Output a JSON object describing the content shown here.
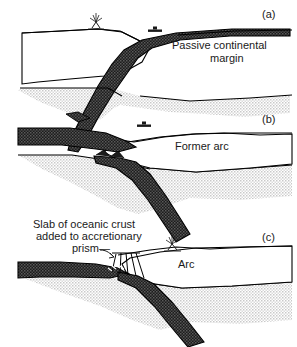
{
  "figure": {
    "type": "geologic-cross-section",
    "panel_count": 3,
    "width": 297,
    "height": 347
  },
  "colors": {
    "oceanic_crust_dark": "#2b2b2b",
    "mantle_stipple_gray": "#d9d9d9",
    "continent_fill": "#ffffff",
    "outline": "#000000",
    "text": "#1a1a1a"
  },
  "panels": [
    {
      "id": "a",
      "letter": "(a)",
      "label": "Passive continental\nmargin",
      "label_line1": "Passive continental",
      "label_line2": "margin",
      "icons": [
        "volcano-icon",
        "ship-icon"
      ]
    },
    {
      "id": "b",
      "letter": "(b)",
      "label": "Former arc",
      "icons": [
        "ship-icon"
      ]
    },
    {
      "id": "c",
      "letter": "(c)",
      "label": "Arc",
      "annotation": "Slab of oceanic crust\nadded to accretionary\nprism—",
      "annotation_line1": "Slab of oceanic crust",
      "annotation_line2": "added to accretionary",
      "annotation_line3": "prism—",
      "icons": [
        "volcano-icon"
      ]
    }
  ],
  "legend_elements": {
    "dark_band": "subducting oceanic crust / slab",
    "stipple": "mantle lithosphere",
    "white_body": "continental crust / arc crust",
    "fan_wedges": "accretionary prism thrust slices"
  }
}
